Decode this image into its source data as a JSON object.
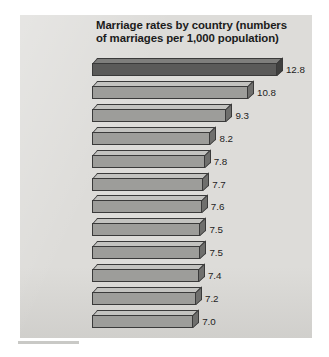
{
  "figure": {
    "title": "Marriage rates by country (numbers of marriages per 1,000 population)",
    "title_line_1": "Marriage rates by country (numbers",
    "title_line_2": "of marriages per 1,000 population)",
    "panel_color": "#dddcd9",
    "background_color": "#ffffff",
    "bar_color": "#9d9d9a",
    "highlight_bar_color": "#5a5a59",
    "bar_outline_color": "#3a3a3a",
    "text_color": "#1d1d1d"
  },
  "chart_data": {
    "type": "bar",
    "orientation": "horizontal",
    "title": "Marriage rates by country (numbers of marriages per 1,000 population)",
    "xlabel": "",
    "ylabel": "",
    "grid": false,
    "legend": null,
    "xlim": [
      0,
      12.8
    ],
    "value_precision": 1,
    "highlight_category": "United States",
    "categories": [
      "United States",
      "Denmark",
      "Japan",
      "Netherlands",
      "Great Britain",
      "Spain",
      "Ireland",
      "France",
      "Germany",
      "Canada",
      "Italy",
      "Sweden"
    ],
    "values": [
      12.8,
      10.8,
      9.3,
      8.2,
      7.8,
      7.7,
      7.6,
      7.5,
      7.5,
      7.4,
      7.2,
      7.0
    ],
    "value_labels": [
      "12.8",
      "10.8",
      "9.3",
      "8.2",
      "7.8",
      "7.7",
      "7.6",
      "7.5",
      "7.5",
      "7.4",
      "7.2",
      "7.0"
    ]
  }
}
